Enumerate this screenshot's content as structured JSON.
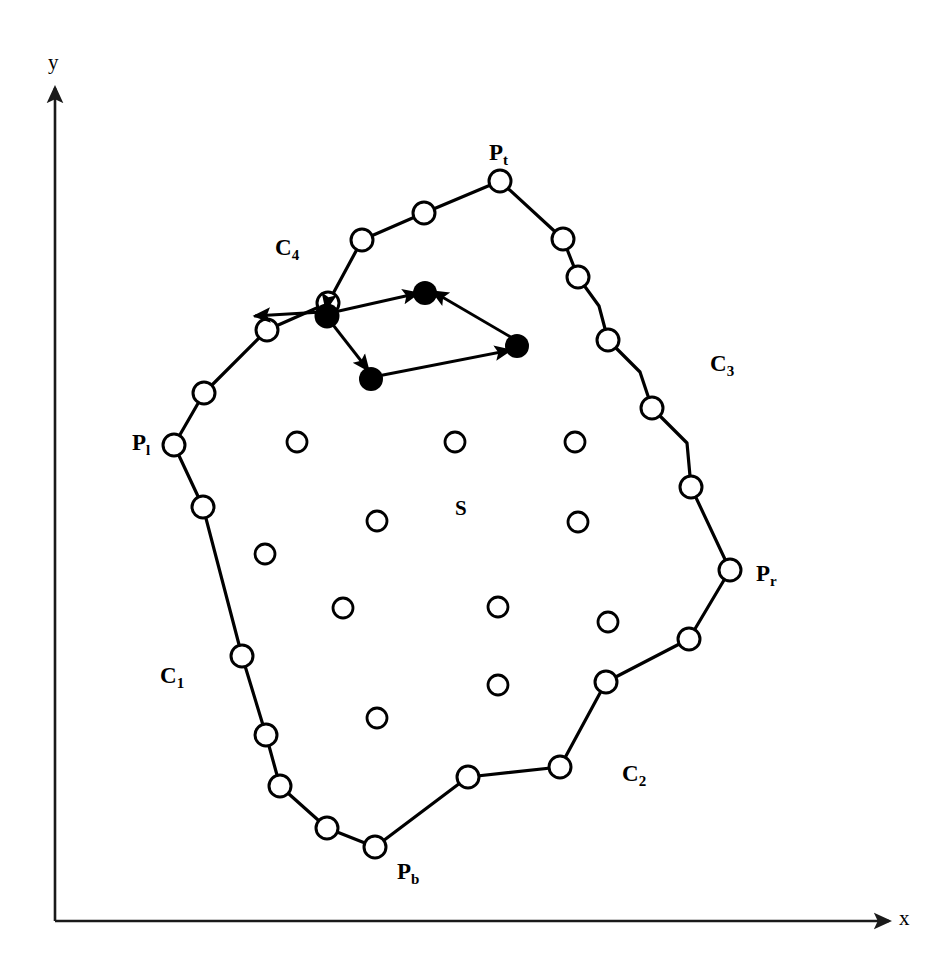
{
  "figure": {
    "type": "geometric-diagram",
    "background_color": "#ffffff",
    "stroke_color": "#000000"
  },
  "axes": {
    "x_label": "x",
    "y_label": "y",
    "origin": {
      "x": 55,
      "y": 921
    },
    "x_end": {
      "x": 895,
      "y": 921
    },
    "y_end": {
      "x": 55,
      "y": 82
    },
    "stroke_width": 2.4,
    "arrowheads": true
  },
  "labels": {
    "extreme_points": [
      {
        "name": "P_t",
        "base": "P",
        "sub": "t",
        "x": 498,
        "y": 157,
        "anchor": "top-vertex"
      },
      {
        "name": "P_r",
        "base": "P",
        "sub": "r",
        "x": 762,
        "y": 578,
        "anchor": "right-vertex"
      },
      {
        "name": "P_b",
        "base": "P",
        "sub": "b",
        "x": 405,
        "y": 876,
        "anchor": "bottom-vertex"
      },
      {
        "name": "P_l",
        "base": "P",
        "sub": "l",
        "x": 140,
        "y": 447,
        "anchor": "left-vertex"
      }
    ],
    "chains": [
      {
        "name": "C_1",
        "base": "C",
        "sub": "1",
        "x": 168,
        "y": 680
      },
      {
        "name": "C_2",
        "base": "C",
        "sub": "2",
        "x": 630,
        "y": 778
      },
      {
        "name": "C_3",
        "base": "C",
        "sub": "3",
        "x": 718,
        "y": 368
      },
      {
        "name": "C_4",
        "base": "C",
        "sub": "4",
        "x": 283,
        "y": 252
      }
    ],
    "region": {
      "name": "S",
      "text": "S",
      "x": 459,
      "y": 508
    }
  },
  "boundary": {
    "stroke_width": 3.2,
    "closed": true,
    "vertices": [
      {
        "x": 500,
        "y": 181,
        "label": "P_t"
      },
      {
        "x": 563,
        "y": 239,
        "label": ""
      },
      {
        "x": 578,
        "y": 277,
        "label": ""
      },
      {
        "x": 599,
        "y": 306,
        "label": ""
      },
      {
        "x": 608,
        "y": 340,
        "label": ""
      },
      {
        "x": 640,
        "y": 372,
        "label": ""
      },
      {
        "x": 652,
        "y": 408,
        "label": ""
      },
      {
        "x": 687,
        "y": 443,
        "label": ""
      },
      {
        "x": 691,
        "y": 487,
        "label": ""
      },
      {
        "x": 730,
        "y": 570,
        "label": "P_r"
      },
      {
        "x": 689,
        "y": 639,
        "label": ""
      },
      {
        "x": 606,
        "y": 682,
        "label": ""
      },
      {
        "x": 560,
        "y": 767,
        "label": ""
      },
      {
        "x": 468,
        "y": 777,
        "label": ""
      },
      {
        "x": 375,
        "y": 847,
        "label": "P_b"
      },
      {
        "x": 327,
        "y": 828,
        "label": ""
      },
      {
        "x": 280,
        "y": 786,
        "label": ""
      },
      {
        "x": 266,
        "y": 735,
        "label": ""
      },
      {
        "x": 242,
        "y": 656,
        "label": ""
      },
      {
        "x": 203,
        "y": 507,
        "label": ""
      },
      {
        "x": 174,
        "y": 445,
        "label": "P_l"
      },
      {
        "x": 204,
        "y": 393,
        "label": ""
      },
      {
        "x": 267,
        "y": 330,
        "label": ""
      },
      {
        "x": 328,
        "y": 303,
        "label": ""
      },
      {
        "x": 362,
        "y": 240,
        "label": ""
      },
      {
        "x": 424,
        "y": 213,
        "label": ""
      }
    ]
  },
  "boundary_markers": {
    "kind": "open-circle",
    "radius": 11,
    "stroke_width": 3.0,
    "fill": "#ffffff",
    "points": [
      {
        "x": 500,
        "y": 181
      },
      {
        "x": 563,
        "y": 239
      },
      {
        "x": 578,
        "y": 277
      },
      {
        "x": 608,
        "y": 340
      },
      {
        "x": 652,
        "y": 408
      },
      {
        "x": 691,
        "y": 487
      },
      {
        "x": 730,
        "y": 570
      },
      {
        "x": 689,
        "y": 639
      },
      {
        "x": 606,
        "y": 682
      },
      {
        "x": 560,
        "y": 767
      },
      {
        "x": 468,
        "y": 777
      },
      {
        "x": 375,
        "y": 847
      },
      {
        "x": 327,
        "y": 828
      },
      {
        "x": 280,
        "y": 786
      },
      {
        "x": 266,
        "y": 735
      },
      {
        "x": 242,
        "y": 656
      },
      {
        "x": 203,
        "y": 507
      },
      {
        "x": 174,
        "y": 445
      },
      {
        "x": 204,
        "y": 393
      },
      {
        "x": 267,
        "y": 330
      },
      {
        "x": 328,
        "y": 303
      },
      {
        "x": 362,
        "y": 240
      },
      {
        "x": 424,
        "y": 213
      }
    ]
  },
  "interior_markers": {
    "kind": "open-circle",
    "radius": 10,
    "stroke_width": 2.8,
    "fill": "#ffffff",
    "points": [
      {
        "x": 297,
        "y": 442
      },
      {
        "x": 455,
        "y": 442
      },
      {
        "x": 575,
        "y": 442
      },
      {
        "x": 377,
        "y": 521
      },
      {
        "x": 578,
        "y": 522
      },
      {
        "x": 265,
        "y": 554
      },
      {
        "x": 343,
        "y": 608
      },
      {
        "x": 498,
        "y": 607
      },
      {
        "x": 608,
        "y": 622
      },
      {
        "x": 498,
        "y": 685
      },
      {
        "x": 377,
        "y": 718
      }
    ]
  },
  "vector_diagram": {
    "filled_marker": {
      "kind": "filled-circle",
      "radius": 12,
      "fill": "#000000"
    },
    "points": [
      {
        "id": "v1",
        "x": 327,
        "y": 316,
        "role": "origin-left"
      },
      {
        "id": "v2",
        "x": 425,
        "y": 293,
        "role": "upper-right"
      },
      {
        "id": "v3",
        "x": 517,
        "y": 346,
        "role": "far-right"
      },
      {
        "id": "v4",
        "x": 371,
        "y": 379,
        "role": "lower"
      }
    ],
    "arrows": [
      {
        "from": "v1",
        "to": "v2",
        "label": ""
      },
      {
        "from": "v1",
        "to": "v4",
        "label": ""
      },
      {
        "from": "v4",
        "to": "v3",
        "label": ""
      },
      {
        "from": "v3",
        "to": "v2",
        "label": ""
      },
      {
        "from": "v1",
        "to": "boundary-left",
        "label": "",
        "tip": {
          "x": 252,
          "y": 317
        }
      },
      {
        "from": "chain",
        "to": "v1",
        "label": "",
        "tail": {
          "x": 328,
          "y": 303
        }
      }
    ],
    "stroke_width": 2.8,
    "arrowhead_length": 17,
    "arrowhead_width": 10
  }
}
